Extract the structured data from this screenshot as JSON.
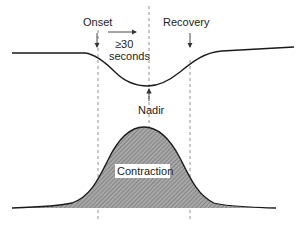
{
  "diagram": {
    "type": "late deceleration vs contraction timing",
    "labels": {
      "onset": "Onset",
      "recovery": "Recovery",
      "duration_line1": "≥30",
      "duration_line2": "seconds",
      "nadir": "Nadir",
      "contraction": "Contraction"
    },
    "colors": {
      "line": "#1a1a1a",
      "dashed": "#777777",
      "fill": "#a8a8a8",
      "hatch": "#6e6e6e",
      "background": "#ffffff"
    },
    "markers": {
      "onset_x": 98,
      "nadir_x": 149,
      "recovery_x": 190
    }
  }
}
